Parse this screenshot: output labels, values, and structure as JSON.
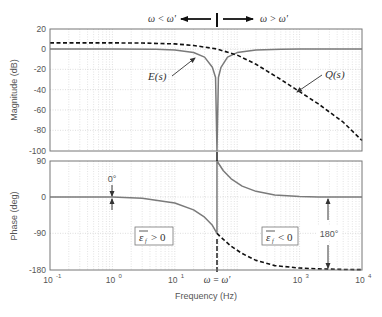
{
  "chart_data": [
    {
      "type": "line",
      "title": "",
      "xlabel": "Frequency  (Hz)",
      "ylabel": "Magnitude (dB)",
      "xscale": "log",
      "xlim": [
        0.1,
        10000
      ],
      "ylim": [
        -100,
        20
      ],
      "grid": true,
      "x_ticks": [
        "10^-1",
        "10^0",
        "10^1",
        "10^3",
        "10^4"
      ],
      "y_ticks": [
        20,
        0,
        -20,
        -40,
        -60,
        -80,
        -100
      ],
      "series": [
        {
          "name": "E(s)",
          "style": "solid-gray",
          "x": [
            0.1,
            1,
            5,
            10,
            20,
            30,
            40,
            45,
            47.4,
            50,
            55,
            70,
            100,
            200,
            500,
            1000,
            10000
          ],
          "values": [
            0,
            0,
            -0.3,
            -1,
            -3.5,
            -8,
            -18,
            -28,
            -100,
            -28,
            -18,
            -8,
            -3.5,
            -1,
            -0.2,
            0,
            0
          ]
        },
        {
          "name": "Q(s)",
          "style": "dashed-black",
          "x": [
            0.1,
            1,
            3,
            10,
            20,
            47.4,
            100,
            200,
            500,
            1000,
            2000,
            5000,
            10000
          ],
          "values": [
            6,
            6,
            5.9,
            5,
            3.5,
            0,
            -6,
            -15,
            -30,
            -42,
            -54,
            -72,
            -90
          ]
        }
      ],
      "annotations": [
        {
          "text": "ω < ω'",
          "arrow": "left"
        },
        {
          "text": "ω > ω'",
          "arrow": "right"
        },
        {
          "text": "E(s)",
          "points_to": "E(s) curve"
        },
        {
          "text": "Q(s)",
          "points_to": "Q(s) curve"
        }
      ]
    },
    {
      "type": "line",
      "title": "",
      "xlabel": "Frequency  (Hz)",
      "ylabel": "Phase (deg)",
      "xscale": "log",
      "xlim": [
        0.1,
        10000
      ],
      "ylim": [
        -180,
        90
      ],
      "grid": true,
      "x_ticks": [
        "10^-1",
        "10^0",
        "10^1",
        "ω = ω'",
        "10^3",
        "10^4"
      ],
      "y_ticks": [
        90,
        0,
        -90,
        -180
      ],
      "series": [
        {
          "name": "E(s) phase",
          "style": "solid-gray",
          "x": [
            0.1,
            1,
            3,
            10,
            20,
            30,
            40,
            47.4,
            47.4,
            60,
            80,
            120,
            200,
            400,
            1000,
            2000,
            10000
          ],
          "values": [
            0,
            0,
            -3,
            -15,
            -32,
            -50,
            -70,
            -90,
            90,
            65,
            45,
            27,
            14,
            5,
            1,
            0,
            0
          ]
        },
        {
          "name": "Q(s) phase",
          "style": "dashed-black",
          "x": [
            47.4,
            60,
            80,
            120,
            200,
            400,
            1000,
            2000,
            5000,
            10000
          ],
          "values": [
            -90,
            -105,
            -122,
            -140,
            -157,
            -170,
            -176,
            -178,
            -179.5,
            -180
          ]
        }
      ],
      "annotations": [
        {
          "text": "0°",
          "type": "double-arrow",
          "at_x": 1
        },
        {
          "text": "ε̄f > 0",
          "type": "boxed-label"
        },
        {
          "text": "ε̄f < 0",
          "type": "boxed-label"
        },
        {
          "text": "180°",
          "type": "double-arrow",
          "at_x": 3000
        },
        {
          "text": "ω = ω'",
          "type": "x-marker",
          "at_x": 47.4
        }
      ]
    }
  ],
  "labels": {
    "mag_ylabel": "Magnitude (dB)",
    "phase_ylabel": "Phase (deg)",
    "xlabel": "Frequency  (Hz)",
    "w_less": "ω < ω'",
    "w_greater": "ω > ω'",
    "E": "E(s)",
    "Q": "Q(s)",
    "zero_deg": "0°",
    "eps_pos": "> 0",
    "eps_neg": "< 0",
    "eps_sym": "ε",
    "eps_sub": "f",
    "deg180": "180°",
    "w_eq": "ω = ω'",
    "mag_ticks": [
      "20",
      "0",
      "-20",
      "-40",
      "-60",
      "-80",
      "-100"
    ],
    "phase_ticks": [
      "90",
      "0",
      "-90",
      "-180"
    ],
    "x_tick_base": "10",
    "x_tick_exps": [
      "-1",
      "0",
      "1",
      "3",
      "4"
    ]
  },
  "colors": {
    "E_curve": "#7a7a7a",
    "Q_curve": "#111111",
    "grid": "#c8c8c8",
    "axes": "#777777",
    "text": "#555555"
  }
}
